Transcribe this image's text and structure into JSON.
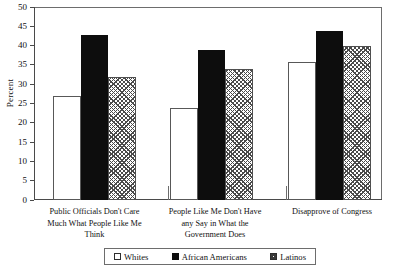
{
  "chart_data": {
    "type": "bar",
    "title": "",
    "xlabel": "",
    "ylabel": "Percent",
    "ylim": [
      0,
      50
    ],
    "yticks": [
      0,
      5,
      10,
      15,
      20,
      25,
      30,
      35,
      40,
      45,
      50
    ],
    "grid": false,
    "legend_position": "bottom",
    "categories": [
      "Public Officials Don't Care\nMuch What People Like Me\nThink",
      "People Like Me Don't Have\nany Say in What the\nGovernment Does",
      "Disapprove of Congress"
    ],
    "series": [
      {
        "name": "Whites",
        "fill": "open",
        "values": [
          27,
          24,
          36
        ]
      },
      {
        "name": "African Americans",
        "fill": "solid",
        "values": [
          43,
          39,
          44
        ]
      },
      {
        "name": "Latinos",
        "fill": "hatched",
        "values": [
          32,
          34,
          40
        ]
      }
    ]
  },
  "legend": {
    "items": [
      {
        "label": "Whites",
        "swatch": "open-square-icon"
      },
      {
        "label": "African Americans",
        "swatch": "filled-square-icon"
      },
      {
        "label": "Latinos",
        "swatch": "hatched-square-icon"
      }
    ]
  },
  "colors": {
    "axis": "#4a4a4a",
    "solid_bar": "#0d0d0d",
    "hatch_bar": "#4a4a4a",
    "open_bar": "#ffffff",
    "background": "#ffffff"
  }
}
